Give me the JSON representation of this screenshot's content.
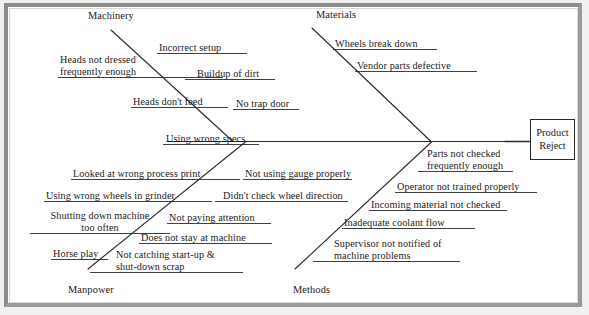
{
  "diagram": {
    "type": "fishbone-ishikawa",
    "effect": {
      "line1": "Product",
      "line2": "Reject"
    },
    "categories": [
      {
        "id": "machinery",
        "label": "Machinery",
        "position": "top-left"
      },
      {
        "id": "materials",
        "label": "Materials",
        "position": "top-right"
      },
      {
        "id": "manpower",
        "label": "Manpower",
        "position": "bottom-left"
      },
      {
        "id": "methods",
        "label": "Methods",
        "position": "bottom-right"
      }
    ],
    "causes": {
      "machinery": [
        "Incorrect setup",
        "Heads not dressed\nfrequently enough",
        "Buildup of dirt",
        "Heads don't feed",
        "No trap door"
      ],
      "materials": [
        "Wheels break down",
        "Vendor parts defective"
      ],
      "manpower": [
        "Using wrong specs",
        "Looked at wrong process print",
        "Using wrong wheels in grinder",
        "Shutting down machine\ntoo often",
        "Horse play"
      ],
      "methods": [
        "Not using gauge properly",
        "Didn't check wheel direction",
        "Not paying attention",
        "Does not stay at machine",
        "Not catching start-up &\nshut-down scrap",
        "Parts not checked\nfrequently enough",
        "Operator not trained properly",
        "Incoming material not checked",
        "Inadequate coolant flow",
        "Supervisor not notified of\nmachine problems"
      ]
    },
    "labels": {
      "incorrect_setup": "Incorrect setup",
      "heads_not_dressed": "Heads not dressed\nfrequently enough",
      "buildup_of_dirt": "Buildup of dirt",
      "heads_dont_feed": "Heads don't feed",
      "no_trap_door": "No trap door",
      "wheels_break_down": "Wheels break down",
      "vendor_parts_defective": "Vendor parts defective",
      "using_wrong_specs": "Using wrong specs",
      "looked_at_wrong_process_print": "Looked at wrong process print",
      "not_using_gauge_properly": "Not using gauge properly",
      "using_wrong_wheels_in_grinder": "Using wrong wheels in grinder",
      "didnt_check_wheel_direction": "Didn't check wheel direction",
      "shutting_down_machine": "Shutting down machine\ntoo often",
      "not_paying_attention": "Not paying attention",
      "does_not_stay_at_machine": "Does not stay at machine",
      "horse_play": "Horse play",
      "not_catching_scrap": "Not catching start-up &\nshut-down scrap",
      "parts_not_checked": "Parts not checked\nfrequently enough",
      "operator_not_trained": "Operator not trained properly",
      "incoming_material_not_checked": "Incoming material not checked",
      "inadequate_coolant_flow": "Inadequate coolant flow",
      "supervisor_not_notified": "Supervisor not notified of\nmachine problems",
      "machinery": "Machinery",
      "materials": "Materials",
      "manpower": "Manpower",
      "methods": "Methods"
    },
    "colors": {
      "line": "#2a2a2a",
      "text": "#1a1a1a",
      "frame": "#8c8c8c",
      "background": "#ffffff"
    }
  }
}
